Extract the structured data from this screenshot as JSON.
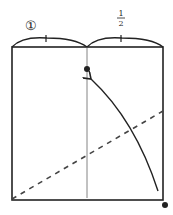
{
  "diagram": {
    "type": "origami-fold-step",
    "labels": {
      "left_marker": "①",
      "fraction_numerator": "1",
      "fraction_denominator": "2"
    },
    "colors": {
      "line": "#222222",
      "fold_line": "#555555",
      "background": "#ffffff"
    },
    "elements": [
      "square-paper",
      "center-crease",
      "measure-arc-left",
      "measure-arc-right",
      "target-dot",
      "fold-arrow",
      "dashed-fold-line",
      "corner-dot"
    ]
  }
}
